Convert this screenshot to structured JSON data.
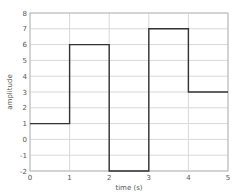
{
  "chart_data": {
    "type": "line",
    "subtype": "step",
    "title": "",
    "xlabel": "time (s)",
    "ylabel": "amplitude",
    "xlim": [
      0,
      5
    ],
    "ylim": [
      -2,
      8
    ],
    "grid": true,
    "x_ticks": [
      "0",
      "1",
      "2",
      "3",
      "4",
      "5"
    ],
    "y_ticks": [
      "-2",
      "-1",
      "0",
      "1",
      "2",
      "3",
      "4",
      "5",
      "6",
      "7",
      "8"
    ],
    "series": [
      {
        "name": "signal",
        "color": "#333333",
        "steps": [
          {
            "x_start": 0,
            "x_end": 1,
            "y": 1
          },
          {
            "x_start": 1,
            "x_end": 2,
            "y": 6
          },
          {
            "x_start": 2,
            "x_end": 3,
            "y": -2
          },
          {
            "x_start": 3,
            "x_end": 4,
            "y": 7
          },
          {
            "x_start": 4,
            "x_end": 5,
            "y": 3
          }
        ],
        "x": [
          0,
          1,
          1,
          2,
          2,
          3,
          3,
          4,
          4,
          5
        ],
        "y": [
          1,
          1,
          6,
          6,
          -2,
          -2,
          7,
          7,
          3,
          3
        ]
      }
    ]
  }
}
